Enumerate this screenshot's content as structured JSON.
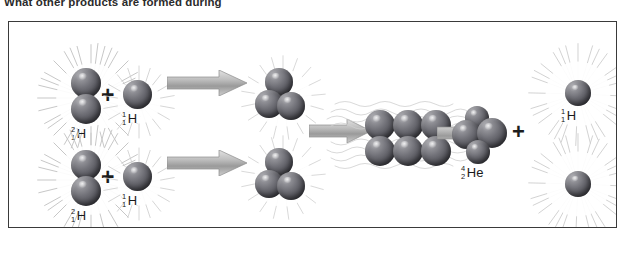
{
  "question": {
    "text": "What other products are formed during"
  },
  "figure": {
    "background_color": "#ffffff",
    "border_color": "#3a3a3a",
    "nucleon_color": "#55555c",
    "arrow_color": "#a8a8a8",
    "burst_color": "#d8d8d8"
  },
  "reactions": [
    {
      "id": "top-row",
      "reactants": [
        {
          "name": "deuterium",
          "mass_number": "2",
          "atomic_number": "1",
          "symbol": "H",
          "nucleons": 2
        },
        {
          "name": "hydrogen",
          "mass_number": "1",
          "atomic_number": "1",
          "symbol": "H",
          "nucleons": 1
        }
      ],
      "operator": "+",
      "product": {
        "name": "helium-3",
        "nucleons": 3,
        "label": ""
      }
    },
    {
      "id": "bottom-row",
      "reactants": [
        {
          "name": "deuterium",
          "mass_number": "2",
          "atomic_number": "1",
          "symbol": "H",
          "nucleons": 2
        },
        {
          "name": "hydrogen",
          "mass_number": "1",
          "atomic_number": "1",
          "symbol": "H",
          "nucleons": 1
        }
      ],
      "operator": "+",
      "product": {
        "name": "helium-3",
        "nucleons": 3,
        "label": ""
      }
    }
  ],
  "fusion_stage": {
    "name": "combined-six-nucleon-cluster",
    "nucleons": 6,
    "rows": 2,
    "columns": 3
  },
  "final_products": [
    {
      "name": "helium-4",
      "mass_number": "4",
      "atomic_number": "2",
      "symbol": "He",
      "nucleons": 4
    },
    {
      "name": "hydrogen",
      "mass_number": "1",
      "atomic_number": "1",
      "symbol": "H",
      "nucleons": 1
    },
    {
      "name": "hydrogen-unlabeled",
      "mass_number": "",
      "atomic_number": "",
      "symbol": "",
      "nucleons": 1
    }
  ],
  "operators": {
    "plus": "+"
  }
}
